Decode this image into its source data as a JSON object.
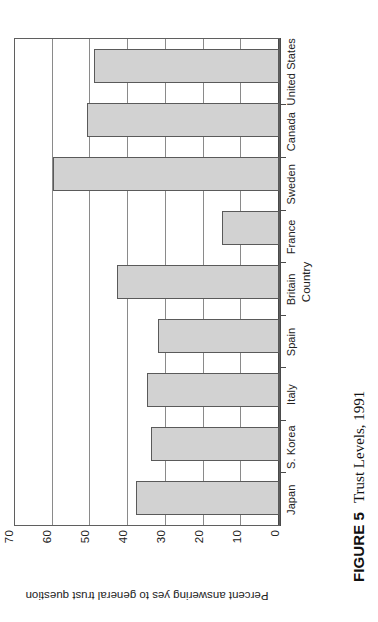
{
  "figure": {
    "caption_label": "FIGURE 5",
    "caption_text": "Trust Levels, 1991"
  },
  "chart_data": {
    "type": "bar",
    "orientation": "vertical",
    "title": "",
    "subtitle": "",
    "xlabel": "Country",
    "ylabel": "Percent answering yes to general trust question",
    "categories": [
      "Japan",
      "S. Korea",
      "Italy",
      "Spain",
      "Britain",
      "France",
      "Sweden",
      "Canada",
      "United States"
    ],
    "values": [
      38,
      34,
      35,
      32,
      43,
      15,
      60,
      51,
      49
    ],
    "ylim": [
      0,
      70
    ],
    "yticks": [
      0,
      10,
      20,
      30,
      40,
      50,
      60,
      70
    ],
    "ytick_labels": [
      "0",
      "10",
      "20",
      "30",
      "40",
      "50",
      "60",
      "70"
    ],
    "grid": true,
    "grid_axis": "y",
    "legend": false,
    "legend_position": "none",
    "bar_fill": "#d2d2d2",
    "bar_edge": "#5a5a5a",
    "axis_color": "#4a4a4a",
    "grid_color": "#8a8a8a",
    "background": "#ffffff"
  }
}
